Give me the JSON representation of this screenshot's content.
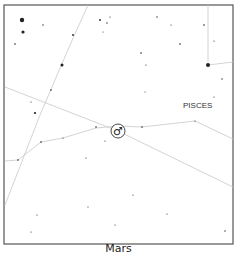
{
  "caption": "Mars",
  "constellation_label": "PISCES",
  "planet": {
    "name": "Mars",
    "symbol": "♂",
    "x": 118,
    "y": 131
  },
  "colors": {
    "frame": "#555555",
    "line": "#c8c8c8",
    "star": "#222222",
    "label": "#333333"
  },
  "frame": {
    "x": 4,
    "y": 5,
    "w": 229,
    "h": 239
  },
  "lines": [
    {
      "name": "boundary-diagonal-1",
      "points": [
        [
          88,
          5
        ],
        [
          70,
          45
        ],
        [
          40,
          115
        ],
        [
          5,
          205
        ]
      ]
    },
    {
      "name": "ecliptic-line",
      "points": [
        [
          5,
          87
        ],
        [
          118,
          131
        ],
        [
          233,
          187
        ]
      ]
    },
    {
      "name": "pisces-line",
      "points": [
        [
          5,
          161
        ],
        [
          18,
          160
        ],
        [
          41,
          142
        ],
        [
          63,
          138
        ],
        [
          96,
          128
        ],
        [
          118,
          126
        ],
        [
          142,
          127
        ],
        [
          195,
          121
        ],
        [
          233,
          139
        ]
      ]
    },
    {
      "name": "boundary-vertical",
      "points": [
        [
          208,
          5
        ],
        [
          208,
          62
        ]
      ]
    },
    {
      "name": "boundary-right-stub",
      "points": [
        [
          208,
          65
        ],
        [
          233,
          62
        ]
      ]
    }
  ],
  "stars": [
    {
      "x": 22,
      "y": 20,
      "r": 2.2
    },
    {
      "x": 23,
      "y": 32,
      "r": 1.6
    },
    {
      "x": 15,
      "y": 44,
      "r": 0.8
    },
    {
      "x": 43,
      "y": 25,
      "r": 0.7
    },
    {
      "x": 73,
      "y": 35,
      "r": 0.9
    },
    {
      "x": 62,
      "y": 65,
      "r": 1.5
    },
    {
      "x": 51,
      "y": 90,
      "r": 0.8
    },
    {
      "x": 31,
      "y": 102,
      "r": 0.6
    },
    {
      "x": 35,
      "y": 113,
      "r": 1.1
    },
    {
      "x": 100,
      "y": 20,
      "r": 0.9
    },
    {
      "x": 107,
      "y": 23,
      "r": 0.7
    },
    {
      "x": 110,
      "y": 17,
      "r": 0.6
    },
    {
      "x": 103,
      "y": 32,
      "r": 0.5
    },
    {
      "x": 157,
      "y": 17,
      "r": 0.7
    },
    {
      "x": 171,
      "y": 25,
      "r": 0.6
    },
    {
      "x": 180,
      "y": 44,
      "r": 0.8
    },
    {
      "x": 141,
      "y": 53,
      "r": 0.8
    },
    {
      "x": 146,
      "y": 65,
      "r": 0.6
    },
    {
      "x": 204,
      "y": 25,
      "r": 0.8
    },
    {
      "x": 214,
      "y": 41,
      "r": 0.6
    },
    {
      "x": 208,
      "y": 65,
      "r": 2.0
    },
    {
      "x": 222,
      "y": 79,
      "r": 0.7
    },
    {
      "x": 145,
      "y": 92,
      "r": 0.5
    },
    {
      "x": 214,
      "y": 97,
      "r": 0.6
    },
    {
      "x": 96,
      "y": 127,
      "r": 0.8
    },
    {
      "x": 142,
      "y": 127,
      "r": 0.8
    },
    {
      "x": 41,
      "y": 142,
      "r": 0.8
    },
    {
      "x": 63,
      "y": 138,
      "r": 0.6
    },
    {
      "x": 18,
      "y": 160,
      "r": 0.8
    },
    {
      "x": 195,
      "y": 121,
      "r": 0.6
    },
    {
      "x": 105,
      "y": 141,
      "r": 0.6
    },
    {
      "x": 86,
      "y": 158,
      "r": 0.6
    },
    {
      "x": 133,
      "y": 195,
      "r": 0.6
    },
    {
      "x": 88,
      "y": 207,
      "r": 0.6
    },
    {
      "x": 167,
      "y": 214,
      "r": 0.6
    },
    {
      "x": 37,
      "y": 215,
      "r": 0.6
    },
    {
      "x": 31,
      "y": 232,
      "r": 0.6
    },
    {
      "x": 115,
      "y": 225,
      "r": 0.6
    },
    {
      "x": 225,
      "y": 231,
      "r": 0.7
    }
  ]
}
